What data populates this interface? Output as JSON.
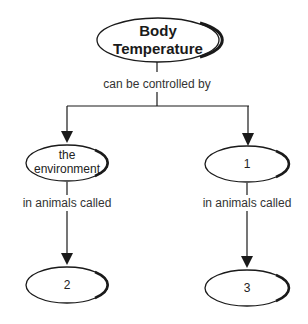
{
  "diagram": {
    "type": "concept-map",
    "colors": {
      "stroke": "#1a1a1a",
      "text": "#222222",
      "background": "#ffffff"
    },
    "nodes": {
      "root": {
        "line1": "Body",
        "line2": "Temperature"
      },
      "left": {
        "line1": "the",
        "line2": "environment"
      },
      "right": {
        "label": "1"
      },
      "bottom_left": {
        "label": "2"
      },
      "bottom_right": {
        "label": "3"
      }
    },
    "edges": {
      "root_to_children": "can be controlled by",
      "left_to_bottom": "in animals called",
      "right_to_bottom": "in animals called"
    }
  }
}
